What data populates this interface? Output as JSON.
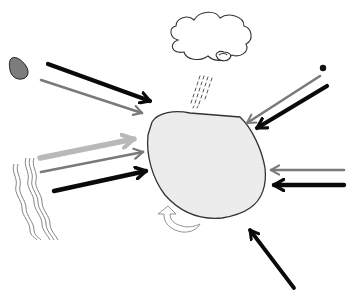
{
  "diagram": {
    "title": "",
    "width": 355,
    "height": 301,
    "colors": {
      "background": "#ffffff",
      "blob_fill": "#ececec",
      "blob_stroke": "#333333",
      "arrow_black": "#0a0a0a",
      "arrow_dark_gray": "#7a7a7a",
      "arrow_light_gray": "#b9b9b9",
      "rock_fill": "#7c7c7c",
      "line_gray": "#777777"
    },
    "elements": [
      {
        "id": "central-body",
        "kind": "irregular blob",
        "label": ""
      },
      {
        "id": "cloud",
        "kind": "cloud with rain",
        "label": ""
      },
      {
        "id": "rock",
        "kind": "small gray stone",
        "label": ""
      },
      {
        "id": "dot",
        "kind": "small black dot",
        "label": ""
      },
      {
        "id": "water",
        "kind": "wavy lines",
        "label": ""
      },
      {
        "id": "rotation",
        "kind": "curved arrow",
        "label": ""
      }
    ],
    "arrows": [
      {
        "from": "upper-left",
        "color": "black",
        "points_to": "central-body"
      },
      {
        "from": "upper-left",
        "color": "dark-gray",
        "points_to": "central-body"
      },
      {
        "from": "left",
        "color": "light-gray",
        "points_to": "central-body"
      },
      {
        "from": "left",
        "color": "dark-gray",
        "points_to": "central-body"
      },
      {
        "from": "left",
        "color": "black",
        "points_to": "central-body"
      },
      {
        "from": "upper-right",
        "color": "dark-gray",
        "points_to": "central-body"
      },
      {
        "from": "upper-right",
        "color": "black",
        "points_to": "central-body"
      },
      {
        "from": "right",
        "color": "dark-gray",
        "points_to": "central-body"
      },
      {
        "from": "right",
        "color": "black",
        "points_to": "central-body"
      },
      {
        "from": "lower-right",
        "color": "black",
        "points_to": "central-body"
      }
    ]
  }
}
